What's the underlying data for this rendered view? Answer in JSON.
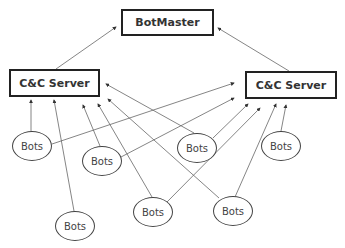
{
  "diagram": {
    "type": "botnet-architecture",
    "botmaster": {
      "label": "BotMaster",
      "x": 121,
      "y": 9,
      "w": 93,
      "h": 27
    },
    "cc_servers": [
      {
        "id": "cc-left",
        "label": "C&C Server",
        "x": 9,
        "y": 69,
        "w": 91,
        "h": 28
      },
      {
        "id": "cc-right",
        "label": "C&C Server",
        "x": 245,
        "y": 71,
        "w": 92,
        "h": 28
      }
    ],
    "bots": [
      {
        "id": "bot-1",
        "label": "Bots",
        "cx": 32,
        "cy": 146
      },
      {
        "id": "bot-2",
        "label": "Bots",
        "cx": 102,
        "cy": 161
      },
      {
        "id": "bot-3",
        "label": "Bots",
        "cx": 197,
        "cy": 148
      },
      {
        "id": "bot-4",
        "label": "Bots",
        "cx": 281,
        "cy": 146
      },
      {
        "id": "bot-5",
        "label": "Bots",
        "cx": 75,
        "cy": 226
      },
      {
        "id": "bot-6",
        "label": "Bots",
        "cx": 153,
        "cy": 212
      },
      {
        "id": "bot-7",
        "label": "Bots",
        "cx": 233,
        "cy": 211
      }
    ],
    "arrows": [
      {
        "from": "cc-left",
        "to": "botmaster",
        "x1": 56,
        "y1": 69,
        "x2": 116,
        "y2": 27
      },
      {
        "from": "cc-right",
        "to": "botmaster",
        "x1": 289,
        "y1": 71,
        "x2": 218,
        "y2": 28
      },
      {
        "from": "bot-1",
        "to": "cc-left",
        "x1": 31,
        "y1": 131,
        "x2": 31,
        "y2": 100
      },
      {
        "from": "bot-1",
        "to": "cc-right",
        "x1": 52,
        "y1": 144,
        "x2": 234,
        "y2": 83
      },
      {
        "from": "bot-2",
        "to": "cc-left",
        "x1": 100,
        "y1": 146,
        "x2": 83,
        "y2": 105
      },
      {
        "from": "bot-2",
        "to": "cc-right",
        "x1": 121,
        "y1": 157,
        "x2": 234,
        "y2": 98
      },
      {
        "from": "bot-3",
        "to": "cc-left",
        "x1": 194,
        "y1": 133,
        "x2": 106,
        "y2": 84
      },
      {
        "from": "bot-3",
        "to": "cc-right",
        "x1": 213,
        "y1": 138,
        "x2": 248,
        "y2": 104
      },
      {
        "from": "bot-4",
        "to": "cc-right",
        "x1": 281,
        "y1": 131,
        "x2": 286,
        "y2": 105
      },
      {
        "from": "bot-5",
        "to": "cc-left",
        "x1": 74,
        "y1": 211,
        "x2": 54,
        "y2": 100
      },
      {
        "from": "bot-6",
        "to": "cc-left",
        "x1": 152,
        "y1": 197,
        "x2": 98,
        "y2": 104
      },
      {
        "from": "bot-6",
        "to": "cc-right",
        "x1": 167,
        "y1": 202,
        "x2": 260,
        "y2": 108
      },
      {
        "from": "bot-7",
        "to": "cc-left",
        "x1": 219,
        "y1": 198,
        "x2": 108,
        "y2": 99
      },
      {
        "from": "bot-7",
        "to": "cc-right",
        "x1": 235,
        "y1": 197,
        "x2": 276,
        "y2": 104
      }
    ]
  },
  "style": {
    "line_color": "#666666",
    "box_border": "#222222",
    "text_color": "#333333"
  }
}
